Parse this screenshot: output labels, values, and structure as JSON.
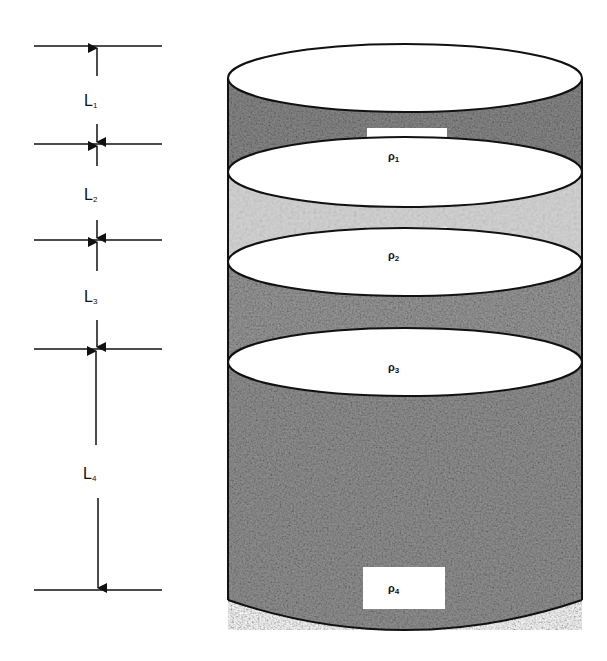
{
  "diagram": {
    "type": "layered-cylinder",
    "layers": [
      {
        "id": 1,
        "thickness_label": "L",
        "thickness_sub": "1",
        "density_label": "ρ",
        "density_sub": "1",
        "texture": "dark-granular",
        "fill": "#8a8a8a"
      },
      {
        "id": 2,
        "thickness_label": "L",
        "thickness_sub": "2",
        "density_label": "ρ",
        "density_sub": "2",
        "texture": "light-granular",
        "fill": "#cfcfcf"
      },
      {
        "id": 3,
        "thickness_label": "L",
        "thickness_sub": "3",
        "density_label": "ρ",
        "density_sub": "3",
        "texture": "medium-granular",
        "fill": "#999999"
      },
      {
        "id": 4,
        "thickness_label": "L",
        "thickness_sub": "4",
        "density_label": "ρ",
        "density_sub": "4",
        "texture": "medium-granular",
        "fill": "#939393"
      }
    ]
  },
  "colors": {
    "background": "#ffffff",
    "stroke": "#111111",
    "ellipse_fill": "#ffffff"
  }
}
